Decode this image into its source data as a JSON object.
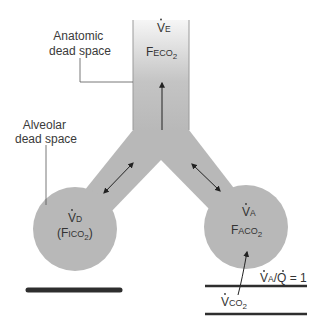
{
  "diagram": {
    "title": "",
    "colors": {
      "airway_fill": "#b8b8b8",
      "airway_fill_top": "#f4f4f4",
      "airway_edge": "#a0a0a0",
      "text": "#3a3a3a",
      "capillary": "#2e2e2e",
      "arrow": "#222222"
    },
    "labels": {
      "anatomic_dead_space_line1": "Anatomic",
      "anatomic_dead_space_line2": "dead space",
      "alveolar_dead_space_line1": "Alveolar",
      "alveolar_dead_space_line2": "dead space"
    },
    "trachea": {
      "ventilation": "V",
      "ventilation_sub": "E",
      "fraction": "F",
      "fraction_sub": "ECO",
      "fraction_subsub": "2"
    },
    "left_alveolus": {
      "ventilation": "V",
      "ventilation_sub": "D",
      "fraction_open": "(F",
      "fraction_sub": "ICO",
      "fraction_subsub": "2",
      "fraction_close": ")"
    },
    "right_alveolus": {
      "ventilation": "V",
      "ventilation_sub": "A",
      "fraction": "F",
      "fraction_sub": "ACO",
      "fraction_subsub": "2"
    },
    "ratio_label": {
      "v": "V",
      "v_sub": "A",
      "slash": "/",
      "q": "Q",
      "equals": " = 1"
    },
    "co2_output": {
      "v": "V",
      "sub": "CO",
      "subsub": "2"
    }
  }
}
